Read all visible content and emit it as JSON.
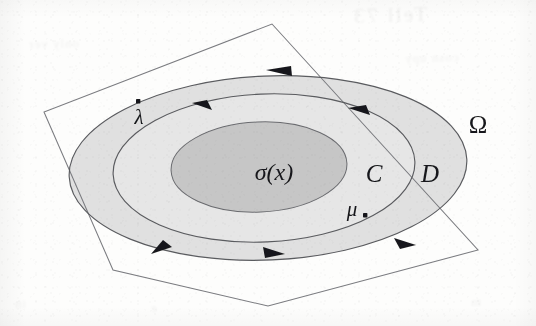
{
  "figure": {
    "kind": "mathematical-diagram",
    "labels": {
      "omega": "Ω",
      "outer_curve": "D",
      "inner_curve": "C",
      "spectrum": "σ(x)",
      "lambda": "λ",
      "mu": "μ"
    },
    "colors": {
      "ink": "#16171a",
      "curve_stroke": "#55565a",
      "polygon_stroke": "#7b7c80",
      "outer_annulus_fill": "#e0e0e0",
      "inner_annulus_fill": "#e6e6e6",
      "spectrum_fill": "#c6c6c6",
      "paper": "#fdfdfc"
    },
    "geometry": {
      "polygon_vertices": "272,24 478,250 268,306 113,270 44,112",
      "outer_ellipse": {
        "cx": 268,
        "cy": 168,
        "rx": 199,
        "ry": 92,
        "rotation": -2.5
      },
      "middle_ellipse": {
        "cx": 264,
        "cy": 168,
        "rx": 151,
        "ry": 74,
        "rotation": -2.5
      },
      "inner_ellipse": {
        "cx": 259,
        "cy": 167,
        "rx": 88,
        "ry": 45,
        "rotation": -2.5
      }
    },
    "orientation": "counterclockwise",
    "marked_points": [
      {
        "name": "lambda",
        "x": 138,
        "y": 101,
        "on_curve": "D"
      },
      {
        "name": "mu",
        "x": 365,
        "y": 215,
        "on_curve": "C"
      }
    ],
    "arrow_count": 6,
    "bleed_through": {
      "top_right": "Tell 73",
      "upper_left": "only ver",
      "mid_right": "cosn upy",
      "bottom_left": "in",
      "bottom_mid": "e",
      "bottom_right": "m"
    }
  }
}
